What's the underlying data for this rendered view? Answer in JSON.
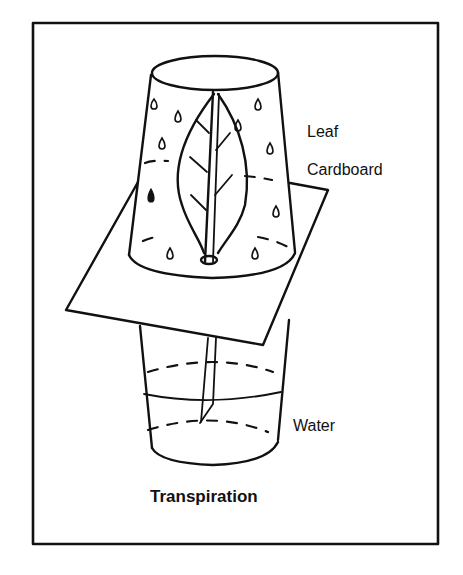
{
  "diagram": {
    "title": "Transpiration",
    "labels": {
      "leaf": "Leaf",
      "cardboard": "Cardboard",
      "water": "Water"
    },
    "components": [
      "inverted-upper-cup",
      "leaf",
      "cardboard-sheet",
      "leaf-stem",
      "lower-cup",
      "water"
    ],
    "colors": {
      "ink": "#111111",
      "background": "#ffffff"
    }
  }
}
